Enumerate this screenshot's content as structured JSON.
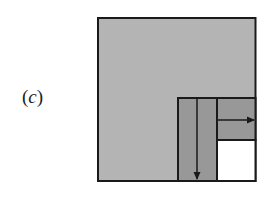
{
  "figure": {
    "panel_label": "(c)",
    "panel_letter": "c",
    "colors": {
      "outer_fill": "#b4b4b4",
      "inner_fill": "#989898",
      "empty_fill": "#ffffff",
      "stroke": "#1a1a1a"
    },
    "regions": [
      {
        "name": "outer-square",
        "fill": "outer_fill"
      },
      {
        "name": "vertical-strip",
        "fill": "inner_fill",
        "arrow": "down"
      },
      {
        "name": "horizontal-strip",
        "fill": "inner_fill",
        "arrow": "right"
      },
      {
        "name": "empty-corner",
        "fill": "empty_fill"
      }
    ]
  }
}
